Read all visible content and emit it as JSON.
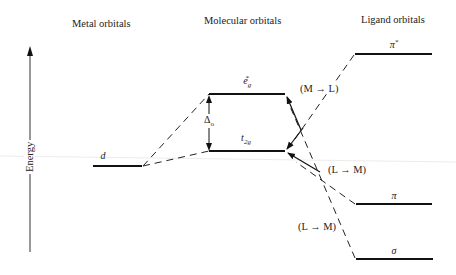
{
  "diagram": {
    "type": "molecular orbital energy level diagram",
    "axis": {
      "label": "Energy",
      "direction": "up"
    },
    "columns": {
      "metal": "Metal orbitals",
      "molecular": "Molecular orbitals",
      "ligand": "Ligand orbitals"
    },
    "levels": {
      "d": {
        "symbol": "d"
      },
      "eg_star": {
        "base": "e",
        "sub": "g",
        "sup": "*"
      },
      "t2g": {
        "base": "t",
        "sub": "2g"
      },
      "pi_star": {
        "base": "π",
        "sup": "*"
      },
      "pi": {
        "base": "π"
      },
      "sigma": {
        "base": "σ"
      }
    },
    "splitting": {
      "base": "Δ",
      "sub": "o"
    },
    "transitions": {
      "m_to_l": "(M → L)",
      "l_to_m_pi": "(L → M)",
      "l_to_m_sigma": "(L → M)"
    },
    "colors": {
      "line": "#111111",
      "text": "#222222",
      "background": "#ffffff"
    }
  }
}
